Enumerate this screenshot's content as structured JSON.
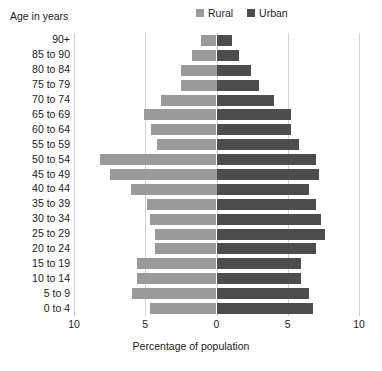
{
  "chart_data": {
    "type": "bar",
    "subtype": "population-pyramid",
    "title": "",
    "xlabel": "Percentage of population",
    "ylabel": "Age in years",
    "orientation": "horizontal",
    "grid": true,
    "legend_position": "top-center",
    "xlim": [
      -10,
      10
    ],
    "xticks": [
      -10,
      -5,
      0,
      5,
      10
    ],
    "xtick_labels": [
      "10",
      "5",
      "0",
      "5",
      "10"
    ],
    "categories": [
      "90+",
      "85 to 90",
      "80 to 84",
      "75 to 79",
      "70 to 74",
      "65 to 69",
      "60 to 64",
      "55 to 59",
      "50 to 54",
      "45 to 49",
      "40 to 44",
      "35 to 39",
      "30 to 34",
      "25 to 29",
      "20 to 24",
      "15 to 19",
      "10 to 14",
      "5 to 9",
      "0 to 4"
    ],
    "series": [
      {
        "name": "Rural",
        "side": "left",
        "color": "#9a9a9a",
        "values": [
          1.1,
          1.7,
          2.5,
          2.5,
          3.9,
          5.1,
          4.6,
          4.2,
          8.2,
          7.5,
          6.0,
          4.9,
          4.7,
          4.3,
          4.3,
          5.6,
          5.6,
          5.9,
          4.7
        ]
      },
      {
        "name": "Urban",
        "side": "right",
        "color": "#4d4d4d",
        "values": [
          1.1,
          1.6,
          2.4,
          3.0,
          4.0,
          5.2,
          5.2,
          5.8,
          7.0,
          7.2,
          6.5,
          7.0,
          7.3,
          7.6,
          7.0,
          5.9,
          5.9,
          6.5,
          6.8
        ]
      }
    ]
  },
  "legend": {
    "items": [
      {
        "label": "Rural",
        "color": "#9a9a9a"
      },
      {
        "label": "Urban",
        "color": "#4d4d4d"
      }
    ]
  },
  "axes": {
    "y_title": "Age in years",
    "x_title": "Percentage of  population"
  }
}
